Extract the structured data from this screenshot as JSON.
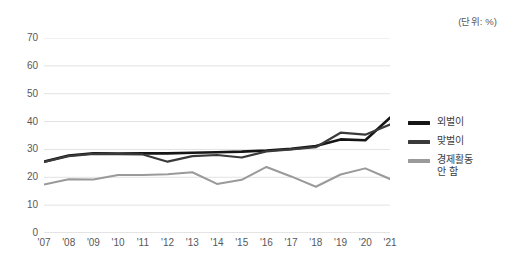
{
  "unit_note": "(단위: %)",
  "legend": {
    "position": "right",
    "items": [
      {
        "label": "외벌이",
        "color": "#151515"
      },
      {
        "label": "맞벌이",
        "color": "#3a3a3a"
      },
      {
        "label": "경제활동\n안 함",
        "color": "#9a9a9a"
      }
    ]
  },
  "axes": {
    "y_ticks": [
      "0",
      "10",
      "20",
      "30",
      "40",
      "50",
      "60",
      "70"
    ],
    "x_ticks": [
      "'07",
      "'08",
      "'09",
      "'10",
      "'11",
      "'12",
      "'13",
      "'14",
      "'15",
      "'16",
      "'17",
      "'18",
      "'19",
      "'20",
      "'21"
    ]
  },
  "chart_data": {
    "type": "line",
    "title": "",
    "subtitle": "",
    "xlabel": "",
    "ylabel": "",
    "unit": "%",
    "unit_note": "(단위: %)",
    "grid": true,
    "legend_position": "right",
    "ylim": [
      0,
      70
    ],
    "ytick_step": 10,
    "yticks": [
      0,
      10,
      20,
      30,
      40,
      50,
      60,
      70
    ],
    "categories": [
      "'07",
      "'08",
      "'09",
      "'10",
      "'11",
      "'12",
      "'13",
      "'14",
      "'15",
      "'16",
      "'17",
      "'18",
      "'19",
      "'20",
      "'21"
    ],
    "x": [
      2007,
      2008,
      2009,
      2010,
      2011,
      2012,
      2013,
      2014,
      2015,
      2016,
      2017,
      2018,
      2019,
      2020,
      2021
    ],
    "series": [
      {
        "name": "외벌이",
        "color": "#151515",
        "width": 2.6,
        "values": [
          25.6,
          27.8,
          28.6,
          28.5,
          28.6,
          28.6,
          28.8,
          29.0,
          29.2,
          29.6,
          30.2,
          31.2,
          33.6,
          33.3,
          41.4
        ]
      },
      {
        "name": "맞벌이",
        "color": "#3a3a3a",
        "width": 2.2,
        "values": [
          25.5,
          27.6,
          28.4,
          28.3,
          28.2,
          25.6,
          27.6,
          28.0,
          27.1,
          29.3,
          30.0,
          30.8,
          36.0,
          35.3,
          38.9
        ]
      },
      {
        "name": "경제활동 안 함",
        "color": "#9a9a9a",
        "width": 2.0,
        "values": [
          17.4,
          19.3,
          19.2,
          20.8,
          20.8,
          21.1,
          21.8,
          17.6,
          19.1,
          23.7,
          20.3,
          16.6,
          21.0,
          23.2,
          19.4
        ]
      }
    ]
  }
}
